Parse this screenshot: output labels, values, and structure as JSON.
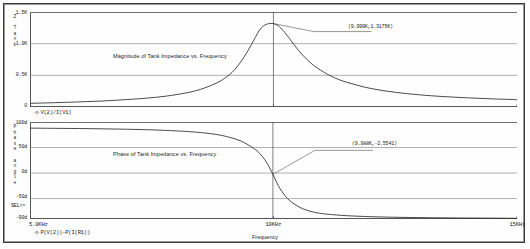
{
  "window": {
    "kind": "pspice-probe-plot"
  },
  "axes": {
    "x_title": "Frequency",
    "x_ticks": [
      {
        "label": "5.0KHz",
        "frac": 0.0
      },
      {
        "label": "10KHz",
        "frac": 0.5
      },
      {
        "label": "15KHz",
        "frac": 1.0
      }
    ]
  },
  "magnitude": {
    "title": "Magnitude of Tank Impedance vs. Frequency",
    "vertical_axis_label": "Z Tank",
    "vertical_axis_chars": [
      "Z",
      "",
      "T",
      "a",
      "n",
      "k"
    ],
    "legend": "V(2)/I(V1)",
    "legend_marker": "◇",
    "annotation": "(9.999K,1.3175K)",
    "y_ticks": [
      {
        "label": "1.5K",
        "value": 1500
      },
      {
        "label": "1.0K",
        "value": 1000
      },
      {
        "label": "0.5K",
        "value": 500
      },
      {
        "label": "0",
        "value": 0
      }
    ]
  },
  "phase": {
    "title": "Phase of Tank Impedance vs. Frequency",
    "vertical_axis_label": "Phase angle",
    "vertical_axis_chars": [
      "P",
      "h",
      "a",
      "s",
      "e",
      "",
      "a",
      "n",
      "g",
      "l",
      "e"
    ],
    "legend": "P(V(2))-P(I(R1))",
    "legend_marker": "◇",
    "annotation": "(9.988K,-2.5541)",
    "selection_marker": "SEL>>",
    "y_ticks": [
      {
        "label": "100d",
        "value": 100
      },
      {
        "label": "50d",
        "value": 50
      },
      {
        "label": "0d",
        "value": 0
      },
      {
        "label": "-50d",
        "value": -50
      },
      {
        "label": "-90d",
        "value": -90
      }
    ]
  },
  "chart_data": [
    {
      "type": "line",
      "id": "magnitude",
      "title": "Magnitude of Tank Impedance vs. Frequency",
      "xlabel": "Frequency",
      "ylabel": "Z Tank",
      "xlim": [
        5000,
        15000
      ],
      "ylim": [
        0,
        1500
      ],
      "xunit": "Hz",
      "yunit": "Ohm",
      "grid": true,
      "legend": [
        "V(2)/I(V1)"
      ],
      "legend_position": "below-plot-left",
      "annotations": [
        {
          "text": "(9.999K,1.3175K)",
          "x": 9999,
          "y": 1317.5
        }
      ],
      "series": [
        {
          "name": "V(2)/I(V1)",
          "x": [
            5000,
            5500,
            6000,
            6500,
            7000,
            7400,
            7800,
            8200,
            8500,
            8800,
            9000,
            9200,
            9400,
            9550,
            9700,
            9800,
            9900,
            9999,
            10100,
            10200,
            10350,
            10500,
            10700,
            10900,
            11200,
            11500,
            12000,
            12500,
            13000,
            13500,
            14000,
            14500,
            15000
          ],
          "y": [
            58,
            68,
            80,
            95,
            118,
            140,
            172,
            222,
            278,
            368,
            455,
            586,
            795,
            990,
            1200,
            1283,
            1315,
            1317.5,
            1280,
            1205,
            1060,
            905,
            740,
            615,
            480,
            392,
            292,
            232,
            192,
            164,
            144,
            128,
            116
          ]
        }
      ]
    },
    {
      "type": "line",
      "id": "phase",
      "title": "Phase of Tank Impedance vs. Frequency",
      "xlabel": "Frequency",
      "ylabel": "Phase angle",
      "xlim": [
        5000,
        15000
      ],
      "ylim": [
        -90,
        100
      ],
      "xunit": "Hz",
      "yunit": "deg",
      "grid": true,
      "legend": [
        "P(V(2))-P(I(R1))"
      ],
      "legend_position": "below-plot-left",
      "annotations": [
        {
          "text": "(9.988K,-2.5541)",
          "x": 9988,
          "y": -2.5541
        }
      ],
      "series": [
        {
          "name": "P(V(2))-P(I(R1))",
          "x": [
            5000,
            5500,
            6000,
            6500,
            7000,
            7500,
            8000,
            8400,
            8800,
            9100,
            9350,
            9550,
            9700,
            9850,
            9988,
            10100,
            10250,
            10400,
            10600,
            10850,
            11100,
            11500,
            12000,
            12600,
            13200,
            13800,
            14400,
            15000
          ],
          "y": [
            88.0,
            87.6,
            87.2,
            86.6,
            85.8,
            84.6,
            82.6,
            80.2,
            76.0,
            70.0,
            62.0,
            51.0,
            40.0,
            22.0,
            -2.55,
            -25.0,
            -46.0,
            -59.0,
            -70.0,
            -77.0,
            -80.5,
            -83.5,
            -85.5,
            -86.8,
            -87.5,
            -88.0,
            -88.3,
            -88.6
          ]
        }
      ]
    }
  ]
}
